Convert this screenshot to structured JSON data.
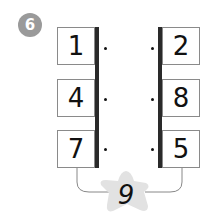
{
  "exercise": {
    "number": "6",
    "left_column": [
      "1",
      "4",
      "7"
    ],
    "right_column": [
      "2",
      "8",
      "5"
    ],
    "answer_star": "9"
  },
  "colors": {
    "badge": "#9a9a9a",
    "bar": "#2a2a2a",
    "star": "#e2e2e2",
    "box_border": "#8a8a8a"
  }
}
